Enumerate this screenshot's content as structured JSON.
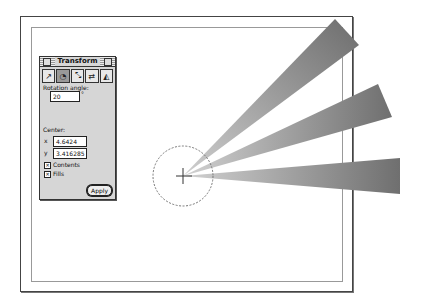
{
  "panel": {
    "title": "Transform",
    "tools": [
      {
        "name": "move-tool",
        "icon": "move-icon",
        "glyph": "↗"
      },
      {
        "name": "rotate-tool",
        "icon": "rotate-icon",
        "glyph": "◔",
        "active": true
      },
      {
        "name": "scale-tool",
        "icon": "scale-icon",
        "glyph": "⤡"
      },
      {
        "name": "reflect-tool",
        "icon": "reflect-icon",
        "glyph": "⇄"
      },
      {
        "name": "skew-tool",
        "icon": "skew-icon",
        "glyph": "◭"
      }
    ],
    "rotation_label": "Rotation angle:",
    "rotation_value": "20",
    "degree_symbol": "°",
    "center_label": "Center:",
    "x_label": "x",
    "x_value": "4.6424",
    "y_label": "y",
    "y_value": "3.416285",
    "contents_label": "Contents",
    "contents_checked": true,
    "fills_label": "Fills",
    "fills_checked": true,
    "check_mark": "✕",
    "apply_label": "Apply"
  },
  "canvas": {
    "rotation_center": {
      "x": 183,
      "y": 176
    },
    "wedge_color": "#7a7a7a"
  }
}
